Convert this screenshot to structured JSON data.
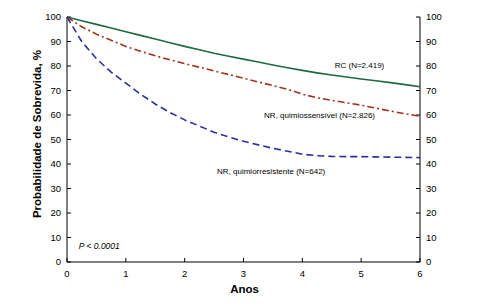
{
  "chart_data": {
    "type": "line",
    "title": "",
    "subtitle": "",
    "xlabel": "Anos",
    "ylabel": "Probabilidade de Sobrevida, %",
    "xlim": [
      0,
      6
    ],
    "ylim": [
      0,
      100
    ],
    "xticks": [
      "0",
      "1",
      "2",
      "3",
      "4",
      "5",
      "6"
    ],
    "yticks": [
      "0",
      "10",
      "20",
      "30",
      "40",
      "50",
      "60",
      "70",
      "80",
      "90",
      "100"
    ],
    "yticks_right": [
      "0",
      "10",
      "20",
      "30",
      "40",
      "50",
      "60",
      "70",
      "80",
      "90",
      "100"
    ],
    "grid": false,
    "legend_position": "inline-annotations",
    "annotations": [
      {
        "name": "p-value",
        "text": "P < 0.0001",
        "x": 0.2,
        "y": 6
      }
    ],
    "series": [
      {
        "name": "RC (N=2.419)",
        "label": "RC (N=2.419)",
        "color": "#1d6b3f",
        "style": "solid",
        "label_x": 4.55,
        "label_y": 79.5,
        "x": [
          0,
          0.25,
          0.5,
          0.75,
          1.0,
          1.25,
          1.5,
          1.75,
          2.0,
          2.25,
          2.5,
          2.75,
          3.0,
          3.25,
          3.5,
          3.75,
          4.0,
          4.25,
          4.5,
          4.75,
          5.0,
          5.25,
          5.5,
          5.75,
          6.0
        ],
        "y": [
          100,
          98.5,
          97,
          95.5,
          94,
          92.5,
          91,
          89.5,
          88,
          86.6,
          85.2,
          84,
          82.8,
          81.6,
          80.4,
          79.3,
          78.2,
          77.2,
          76.3,
          75.5,
          74.7,
          74,
          73.2,
          72.4,
          71.5
        ]
      },
      {
        "name": "NR, quimiossensivel (N=2.826)",
        "label": "NR, quimiossensível (N=2.826)",
        "color": "#a03318",
        "style": "dash-dot",
        "label_x": 3.35,
        "label_y": 59,
        "x": [
          0,
          0.25,
          0.5,
          0.75,
          1.0,
          1.25,
          1.5,
          1.75,
          2.0,
          2.25,
          2.5,
          2.75,
          3.0,
          3.25,
          3.5,
          3.75,
          4.0,
          4.25,
          4.5,
          4.75,
          5.0,
          5.25,
          5.5,
          5.75,
          6.0
        ],
        "y": [
          100,
          96,
          93,
          90.5,
          88,
          86,
          84.2,
          82.5,
          81,
          79.5,
          78,
          76.5,
          75,
          73.5,
          72,
          70.5,
          68.5,
          67,
          66,
          65,
          64,
          62.8,
          61.6,
          60.5,
          59.5
        ]
      },
      {
        "name": "NR, quimiorresistente (N=642)",
        "label": "NR, quimiorresistente (N=642)",
        "color": "#2a2f9e",
        "style": "dashed",
        "label_x": 2.55,
        "label_y": 36.5,
        "x": [
          0,
          0.25,
          0.5,
          0.75,
          1.0,
          1.25,
          1.5,
          1.75,
          2.0,
          2.25,
          2.5,
          2.75,
          3.0,
          3.25,
          3.5,
          3.75,
          4.0,
          4.25,
          4.5,
          4.75,
          5.0,
          5.25,
          5.5,
          5.75,
          6.0
        ],
        "y": [
          100,
          90,
          83,
          77.5,
          73,
          68.5,
          64.5,
          61,
          58,
          55.5,
          53,
          51,
          49.3,
          47.8,
          46.4,
          45.2,
          44,
          43.4,
          43.1,
          43,
          43,
          42.9,
          42.8,
          42.7,
          42.6
        ]
      }
    ]
  },
  "axis": {
    "y_title": "Probabilidade de Sobrevida, %",
    "x_title": "Anos"
  }
}
